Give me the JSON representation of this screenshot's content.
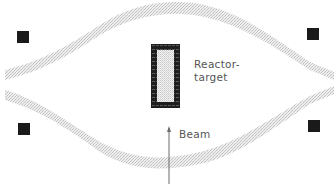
{
  "diagram": {
    "title": "",
    "labels": {
      "target_line1": "Reactor-",
      "target_line2": "target",
      "beam": "Beam"
    },
    "components": {
      "reactor_target": {
        "shape": "rectangle",
        "fill": "dotted-grey",
        "border": "thick-black-hatched"
      },
      "upper_band": {
        "shape": "s-curve",
        "fill": "light-stippled-grey",
        "direction": "rising-left-to-right"
      },
      "lower_band": {
        "shape": "s-curve",
        "fill": "light-stippled-grey",
        "direction": "rising-right-to-left"
      },
      "magnets": [
        {
          "position": "upper-left"
        },
        {
          "position": "upper-right"
        },
        {
          "position": "lower-left"
        },
        {
          "position": "lower-right"
        }
      ],
      "beam_arrow": {
        "direction": "up"
      }
    },
    "colors": {
      "background": "#ffffff",
      "band_fill": "#d8d8d8",
      "magnet": "#1a1a1a",
      "target_border": "#1e1e1e",
      "target_fill": "#e6e6e6",
      "text": "#555555"
    }
  }
}
